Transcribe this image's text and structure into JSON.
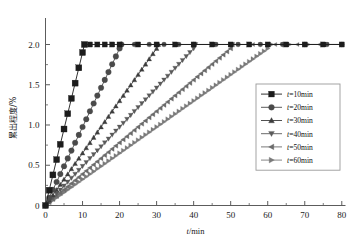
{
  "chart_data": {
    "type": "line",
    "title": "",
    "xlabel": "t/min",
    "ylabel": "累出程度/%",
    "xlim": [
      0,
      81
    ],
    "ylim": [
      0,
      2.18
    ],
    "xticks": [
      0,
      10,
      20,
      30,
      40,
      50,
      60,
      70,
      80
    ],
    "xticklabels": [
      "0",
      "10",
      "20",
      "30",
      "40",
      "50",
      "60",
      "70",
      "80"
    ],
    "yticks": [
      0,
      0.5,
      1.0,
      1.5,
      2.0
    ],
    "yticklabels": [
      "0",
      "0.5",
      "1.0",
      "1.5",
      "2.0"
    ],
    "minor_ytick_step": 0.25,
    "minor_xtick_step": 5,
    "grid": false,
    "legend_position": "right-middle",
    "plateau_value": 2.0,
    "series": [
      {
        "name": "t=10min",
        "marker": "square",
        "color": "#1c1c1c",
        "marker_size": 3.0,
        "marker_step": 1,
        "ramp_end_x": 10.5,
        "x": [
          0,
          1,
          2,
          3,
          4,
          5,
          6,
          7,
          8,
          9,
          10,
          10.5,
          12,
          14,
          16,
          18,
          20,
          25,
          30,
          35,
          40,
          45,
          50,
          55,
          60,
          65,
          70,
          75,
          80
        ],
        "y": [
          0.0,
          0.19,
          0.38,
          0.57,
          0.76,
          0.95,
          1.14,
          1.33,
          1.52,
          1.71,
          1.9,
          2.0,
          2.0,
          2.0,
          2.0,
          2.0,
          2.0,
          2.0,
          2.0,
          2.0,
          2.0,
          2.0,
          2.0,
          2.0,
          2.0,
          2.0,
          2.0,
          2.0,
          2.0
        ]
      },
      {
        "name": "t=20min",
        "marker": "circle",
        "color": "#4a4a4a",
        "marker_size": 2.8,
        "marker_step": 1,
        "ramp_end_x": 20.5,
        "x": [
          0,
          1,
          2,
          3,
          4,
          5,
          6,
          7,
          8,
          9,
          10,
          11,
          12,
          13,
          14,
          15,
          16,
          17,
          18,
          19,
          20,
          20.5,
          24,
          28,
          32,
          36,
          40,
          46,
          52,
          58,
          64,
          70,
          76,
          80
        ],
        "y": [
          0.0,
          0.097,
          0.195,
          0.292,
          0.39,
          0.487,
          0.585,
          0.682,
          0.78,
          0.877,
          0.975,
          1.072,
          1.17,
          1.267,
          1.365,
          1.462,
          1.56,
          1.657,
          1.755,
          1.852,
          1.95,
          2.0,
          2.0,
          2.0,
          2.0,
          2.0,
          2.0,
          2.0,
          2.0,
          2.0,
          2.0,
          2.0,
          2.0,
          2.0
        ]
      },
      {
        "name": "t=30min",
        "marker": "triangle-up",
        "color": "#3d3d3d",
        "marker_size": 2.4,
        "marker_step": 1,
        "ramp_end_x": 30.5,
        "x": [
          0,
          1,
          2,
          3,
          4,
          5,
          6,
          7,
          8,
          9,
          10,
          11,
          12,
          13,
          14,
          15,
          16,
          17,
          18,
          19,
          20,
          21,
          22,
          23,
          24,
          25,
          26,
          27,
          28,
          29,
          30,
          30.5,
          35,
          40,
          45,
          50,
          55,
          60,
          65,
          70,
          75,
          80
        ],
        "y": [
          0.0,
          0.065,
          0.13,
          0.195,
          0.26,
          0.325,
          0.39,
          0.455,
          0.52,
          0.585,
          0.65,
          0.715,
          0.78,
          0.845,
          0.91,
          0.975,
          1.04,
          1.105,
          1.17,
          1.235,
          1.3,
          1.365,
          1.43,
          1.495,
          1.56,
          1.625,
          1.69,
          1.755,
          1.82,
          1.885,
          1.95,
          2.0,
          2.0,
          2.0,
          2.0,
          2.0,
          2.0,
          2.0,
          2.0,
          2.0,
          2.0,
          2.0
        ]
      },
      {
        "name": "t=40min",
        "marker": "triangle-down",
        "color": "#5a5a5a",
        "marker_size": 2.4,
        "marker_step": 1,
        "ramp_end_x": 40.5,
        "x": [
          0,
          1,
          2,
          3,
          4,
          5,
          6,
          7,
          8,
          9,
          10,
          11,
          12,
          13,
          14,
          15,
          16,
          17,
          18,
          19,
          20,
          21,
          22,
          23,
          24,
          25,
          26,
          27,
          28,
          29,
          30,
          31,
          32,
          33,
          34,
          35,
          36,
          37,
          38,
          39,
          40,
          40.5,
          46,
          52,
          58,
          64,
          70,
          76,
          80
        ],
        "y": [
          0.0,
          0.0487,
          0.0975,
          0.146,
          0.195,
          0.244,
          0.292,
          0.341,
          0.39,
          0.438,
          0.487,
          0.536,
          0.585,
          0.633,
          0.682,
          0.731,
          0.78,
          0.828,
          0.877,
          0.926,
          0.975,
          1.023,
          1.072,
          1.121,
          1.17,
          1.218,
          1.267,
          1.316,
          1.365,
          1.413,
          1.462,
          1.511,
          1.56,
          1.608,
          1.657,
          1.706,
          1.755,
          1.803,
          1.852,
          1.901,
          1.95,
          2.0,
          2.0,
          2.0,
          2.0,
          2.0,
          2.0,
          2.0,
          2.0
        ]
      },
      {
        "name": "t=50min",
        "marker": "triangle-left",
        "color": "#6b6b6b",
        "marker_size": 2.4,
        "marker_step": 1,
        "ramp_end_x": 50.5,
        "x": [
          0,
          1,
          2,
          3,
          4,
          5,
          6,
          7,
          8,
          9,
          10,
          11,
          12,
          13,
          14,
          15,
          16,
          17,
          18,
          19,
          20,
          21,
          22,
          23,
          24,
          25,
          26,
          27,
          28,
          29,
          30,
          31,
          32,
          33,
          34,
          35,
          36,
          37,
          38,
          39,
          40,
          41,
          42,
          43,
          44,
          45,
          46,
          47,
          48,
          49,
          50,
          50.5,
          56,
          62,
          68,
          74,
          80
        ],
        "y": [
          0.0,
          0.039,
          0.078,
          0.117,
          0.156,
          0.195,
          0.234,
          0.273,
          0.312,
          0.351,
          0.39,
          0.429,
          0.468,
          0.507,
          0.546,
          0.585,
          0.624,
          0.663,
          0.702,
          0.741,
          0.78,
          0.819,
          0.858,
          0.897,
          0.936,
          0.975,
          1.014,
          1.053,
          1.092,
          1.131,
          1.17,
          1.209,
          1.248,
          1.287,
          1.326,
          1.365,
          1.404,
          1.443,
          1.482,
          1.521,
          1.56,
          1.599,
          1.638,
          1.677,
          1.716,
          1.755,
          1.794,
          1.833,
          1.872,
          1.911,
          1.95,
          2.0,
          2.0,
          2.0,
          2.0,
          2.0,
          2.0
        ]
      },
      {
        "name": "t=60min",
        "marker": "triangle-right",
        "color": "#7a7a7a",
        "marker_size": 2.4,
        "marker_step": 1,
        "ramp_end_x": 61,
        "x": [
          0,
          1,
          2,
          3,
          4,
          5,
          6,
          7,
          8,
          9,
          10,
          11,
          12,
          13,
          14,
          15,
          16,
          17,
          18,
          19,
          20,
          21,
          22,
          23,
          24,
          25,
          26,
          27,
          28,
          29,
          30,
          31,
          32,
          33,
          34,
          35,
          36,
          37,
          38,
          39,
          40,
          41,
          42,
          43,
          44,
          45,
          46,
          47,
          48,
          49,
          50,
          51,
          52,
          53,
          54,
          55,
          56,
          57,
          58,
          59,
          60,
          61,
          66,
          71,
          76,
          80
        ],
        "y": [
          0.0,
          0.0325,
          0.065,
          0.0975,
          0.13,
          0.1625,
          0.195,
          0.2275,
          0.26,
          0.2925,
          0.325,
          0.3575,
          0.39,
          0.4225,
          0.455,
          0.4875,
          0.52,
          0.5525,
          0.585,
          0.6175,
          0.65,
          0.6825,
          0.715,
          0.7475,
          0.78,
          0.8125,
          0.845,
          0.8775,
          0.91,
          0.9425,
          0.975,
          1.0075,
          1.04,
          1.0725,
          1.105,
          1.1375,
          1.17,
          1.2025,
          1.235,
          1.2675,
          1.3,
          1.3325,
          1.365,
          1.3975,
          1.43,
          1.4625,
          1.495,
          1.5275,
          1.56,
          1.5925,
          1.625,
          1.6575,
          1.69,
          1.7225,
          1.755,
          1.7875,
          1.82,
          1.8525,
          1.885,
          1.9175,
          1.95,
          2.0,
          2.0,
          2.0,
          2.0,
          2.0
        ]
      }
    ],
    "legend_entries": [
      {
        "label": "t=10min",
        "marker": "square",
        "color": "#1c1c1c"
      },
      {
        "label": "t=20min",
        "marker": "circle",
        "color": "#4a4a4a"
      },
      {
        "label": "t=30min",
        "marker": "triangle-up",
        "color": "#3d3d3d"
      },
      {
        "label": "t=40min",
        "marker": "triangle-down",
        "color": "#5a5a5a"
      },
      {
        "label": "t=50min",
        "marker": "triangle-left",
        "color": "#6b6b6b"
      },
      {
        "label": "t=60min",
        "marker": "triangle-right",
        "color": "#7a7a7a"
      }
    ]
  },
  "style": {
    "axis_color": "#5c5c5c",
    "legend_border": "#9a9a9a",
    "background": "#ffffff",
    "text_color": "#1a1a1a"
  }
}
